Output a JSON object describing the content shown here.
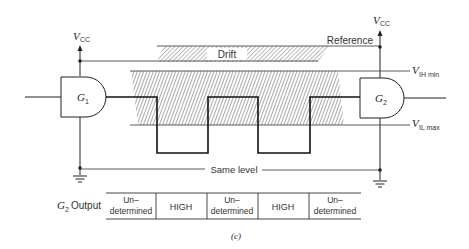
{
  "figure": {
    "caption": "(c)",
    "vcc_label": "V",
    "vcc_sub": "CC",
    "gate1_label": "G",
    "gate1_sub": "1",
    "gate2_label": "G",
    "gate2_sub": "2",
    "drift_label": "Drift",
    "reference_label": "Reference",
    "vih_label": "V",
    "vih_sub": "IH min",
    "vil_label": "V",
    "vil_sub": "IL max",
    "same_level_label": "Same level"
  },
  "output_table": {
    "row_label_g": "G",
    "row_label_sub": "2",
    "row_label_text": "Output",
    "cells": [
      {
        "line1": "Un–",
        "line2": "determined"
      },
      {
        "line1": "HIGH",
        "line2": ""
      },
      {
        "line1": "Un–",
        "line2": "determined"
      },
      {
        "line1": "HIGH",
        "line2": ""
      },
      {
        "line1": "Un–",
        "line2": "determined"
      }
    ]
  },
  "colors": {
    "line": "#222222",
    "hatch": "#555555",
    "background": "#ffffff"
  }
}
